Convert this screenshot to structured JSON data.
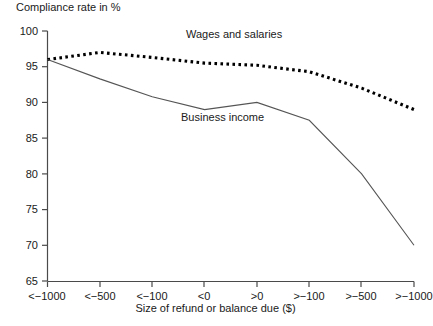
{
  "chart_data": {
    "type": "line",
    "title": "",
    "ylabel": "Compliance rate in %",
    "xlabel": "Size of refund or balance due ($)",
    "categories": [
      "<−1000",
      "<−500",
      "<−100",
      "<0",
      ">0",
      ">−100",
      ">−500",
      ">−1000"
    ],
    "ylim": [
      65,
      100
    ],
    "yticks": [
      65,
      70,
      75,
      80,
      85,
      90,
      95,
      100
    ],
    "grid": false,
    "legend_position": "inline-annotations",
    "series": [
      {
        "name": "Wages and salaries",
        "style": "dotted",
        "color": "#000000",
        "values": [
          96.0,
          97.0,
          96.3,
          95.5,
          95.2,
          94.3,
          92.0,
          89.0
        ]
      },
      {
        "name": "Business income",
        "style": "solid",
        "color": "#555555",
        "values": [
          96.0,
          93.3,
          90.8,
          89.0,
          90.0,
          87.5,
          80.0,
          70.0
        ]
      }
    ]
  },
  "axis": {
    "y_title": "Compliance rate in %",
    "x_title": "Size of refund or balance due ($)",
    "y_tick_labels": [
      "100",
      "95",
      "90",
      "85",
      "80",
      "75",
      "70",
      "65"
    ],
    "x_tick_labels": [
      "<−1000",
      "<−500",
      "<−100",
      "<0",
      ">0",
      ">−100",
      ">−500",
      ">−1000"
    ]
  },
  "annotations": {
    "wages_label": "Wages and salaries",
    "business_label": "Business income"
  }
}
